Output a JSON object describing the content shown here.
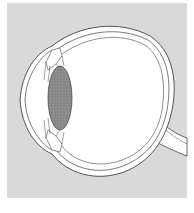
{
  "diagram": {
    "title": "",
    "labels": [],
    "colors": {
      "page_background": "#ffffff",
      "panel_background": "#d9d9d9",
      "eye_fill": "#ffffff",
      "outline": "#444444",
      "lens_fill": "#8c8c8c",
      "lens_stipple": "#6e6e6e"
    }
  }
}
